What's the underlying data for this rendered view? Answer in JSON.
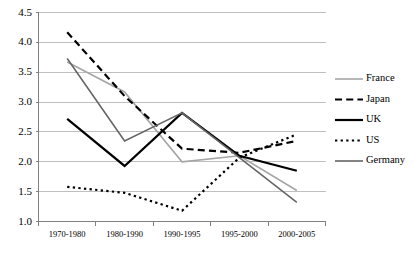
{
  "chart_data": {
    "type": "line",
    "title": "",
    "xlabel": "",
    "ylabel": "",
    "categories": [
      "1970-1980",
      "1980-1990",
      "1990-1995",
      "1995-2000",
      "2000-2005"
    ],
    "ylim": [
      1.0,
      4.5
    ],
    "ytick_labels": [
      "1.0",
      "1.5",
      "2.0",
      "2.5",
      "3.0",
      "3.5",
      "4.0",
      "4.5"
    ],
    "ytick_values": [
      1.0,
      1.5,
      2.0,
      2.5,
      3.0,
      3.5,
      4.0,
      4.5
    ],
    "grid": true,
    "legend_position": "right",
    "series": [
      {
        "name": "France",
        "values": [
          3.67,
          3.17,
          2.0,
          2.1,
          1.52
        ],
        "color": "#a6a6a6",
        "style": "solid",
        "width": 1.6
      },
      {
        "name": "Japan",
        "values": [
          4.17,
          3.1,
          2.22,
          2.15,
          2.35
        ],
        "color": "#000000",
        "style": "dashed",
        "width": 2.2
      },
      {
        "name": "UK",
        "values": [
          2.72,
          1.93,
          2.82,
          2.1,
          1.85
        ],
        "color": "#000000",
        "style": "solid",
        "width": 2.2
      },
      {
        "name": "US",
        "values": [
          1.58,
          1.48,
          1.18,
          2.07,
          2.46
        ],
        "color": "#000000",
        "style": "dotted",
        "width": 2.2
      },
      {
        "name": "Germany",
        "values": [
          3.73,
          2.35,
          2.82,
          2.07,
          1.32
        ],
        "color": "#666666",
        "style": "solid",
        "width": 1.6
      }
    ]
  },
  "axis": {
    "gridline_color": "#bfbfbf",
    "axis_color": "#808080"
  }
}
